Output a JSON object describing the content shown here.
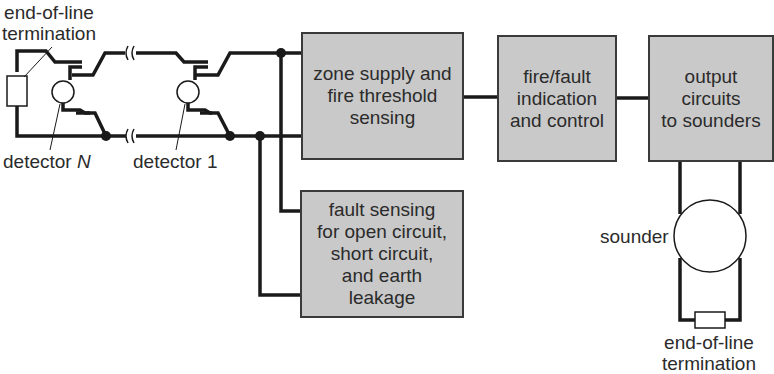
{
  "diagram": {
    "type": "block-diagram",
    "colors": {
      "box_fill": "#c9c9c9",
      "line": "#1a1a1a",
      "text": "#2b2b2b",
      "background": "#ffffff"
    },
    "blocks": {
      "zone_supply": {
        "lines": [
          "zone supply and",
          "fire threshold",
          "sensing"
        ]
      },
      "indication": {
        "lines": [
          "fire/fault",
          "indication",
          "and control"
        ]
      },
      "output": {
        "lines": [
          "output",
          "circuits",
          "to sounders"
        ]
      },
      "fault_sensing": {
        "lines": [
          "fault sensing",
          "for open circuit,",
          "short circuit,",
          "and earth",
          "leakage"
        ]
      }
    },
    "labels": {
      "eol_top": {
        "lines": [
          "end-of-line",
          "termination"
        ]
      },
      "detector_n_prefix": "detector ",
      "detector_n_var": "N",
      "detector_1": "detector 1",
      "sounder": "sounder",
      "eol_bottom": {
        "lines": [
          "end-of-line",
          "termination"
        ]
      }
    },
    "connections": [
      {
        "from": "detector circuit",
        "to": "zone_supply"
      },
      {
        "from": "detector circuit",
        "to": "fault_sensing"
      },
      {
        "from": "zone_supply",
        "to": "indication"
      },
      {
        "from": "indication",
        "to": "output"
      },
      {
        "from": "output",
        "to": "sounder"
      },
      {
        "from": "sounder",
        "to": "eol_bottom"
      }
    ]
  }
}
